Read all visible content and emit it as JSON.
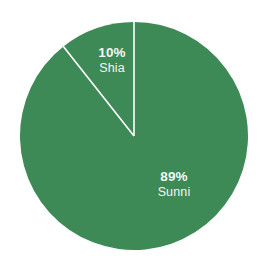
{
  "chart_data": {
    "type": "pie",
    "title": "",
    "subtitle": "",
    "xlabel": "",
    "ylabel": "",
    "grid": false,
    "legend_position": "none",
    "labels_inside": true,
    "start_angle_deg": 0,
    "direction": "clockwise",
    "units": "percent",
    "categories": [
      "Sunni",
      "Shia"
    ],
    "values": [
      89,
      10
    ],
    "slices": [
      {
        "name": "Sunni",
        "value": 89,
        "value_label": "89%",
        "color": "#3e8a57",
        "label_text": "89%\nSunni"
      },
      {
        "name": "Shia",
        "value": 10,
        "value_label": "10%",
        "color": "#3e8a57",
        "label_text": "10%\nShia"
      }
    ],
    "annotations": []
  },
  "chart": {
    "shia": {
      "percent": "10%",
      "name": "Shia"
    },
    "sunni": {
      "percent": "89%",
      "name": "Sunni"
    }
  },
  "colors": {
    "background": "#ffffff",
    "slice_green": "#3e8a57",
    "separator": "#ffffff",
    "label_text": "#f4f7f4"
  },
  "geometry": {
    "center_x": 134,
    "center_y": 136,
    "radius": 114
  }
}
